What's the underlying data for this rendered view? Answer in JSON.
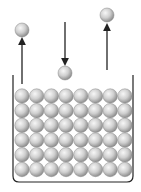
{
  "diagram": {
    "grid": {
      "rows": 6,
      "cols": 8
    },
    "free_particles": [
      {
        "name": "escaping-particle-left",
        "direction": "up"
      },
      {
        "name": "returning-particle-middle",
        "direction": "down"
      },
      {
        "name": "escaping-particle-right",
        "direction": "up"
      }
    ],
    "colors": {
      "particle_light": "#f2f2f2",
      "particle_mid": "#c4c4c4",
      "particle_dark": "#8a8a8a",
      "stroke": "#222222",
      "background": "#ffffff"
    }
  }
}
